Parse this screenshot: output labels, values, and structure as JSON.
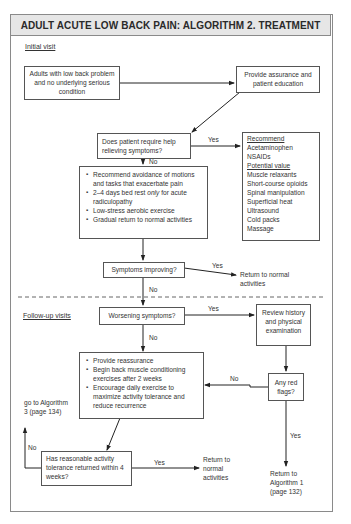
{
  "title": "ADULT ACUTE LOW BACK PAIN: ALGORITHM 2. TREATMENT",
  "sections": {
    "initial": "Initial visit",
    "followup": "Follow-up visits"
  },
  "nodes": {
    "adults": "Adults with low back problem and no underlying serious condition",
    "assurance": "Provide assurance and patient education",
    "require_help": "Does patient require help relieving symptoms?",
    "recommend": {
      "heading": "Recommend",
      "items": [
        "Acetaminophen",
        "NSAIDs"
      ],
      "potential_heading": "Potential value",
      "potential_items": [
        "Muscle relaxants",
        "Short-course opioids",
        "Spinal manipulation",
        "Superficial heat",
        "Ultrasound",
        "Cold packs",
        "Massage"
      ]
    },
    "advice": {
      "items": [
        "Recommend avoidance of motions and tasks that exacerbate pain",
        "2–4 days bed rest",
        "Low-stress aerobic exercise",
        "Gradual return to normal activities"
      ],
      "bed_rest_only": "only",
      "bed_rest_rest": " for acute radiculopathy"
    },
    "improving": "Symptoms improving?",
    "return_normal_1": "Return to normal activities",
    "worsening": "Worsening symptoms?",
    "review": "Review history and physical examination",
    "followup_actions": [
      "Provide reassurance",
      "Begin back muscle conditioning exercises after 2 weeks",
      "Encourage daily exercise to maximize activity tolerance and reduce recurrence"
    ],
    "red_flags": "Any red flags?",
    "activity_tolerance": "Has reasonable activity tolerance returned within 4 weeks?",
    "algorithm3": "go to Algorithm 3 (page 134)",
    "return_normal_2": "Return to normal activities",
    "algorithm1": "Return to Algorithm 1 (page 132)"
  },
  "edge_labels": {
    "yes": "Yes",
    "no": "No"
  },
  "colors": {
    "header_bg": "#e6e6e6",
    "border": "#555555",
    "frame": "#8a8a8a"
  }
}
